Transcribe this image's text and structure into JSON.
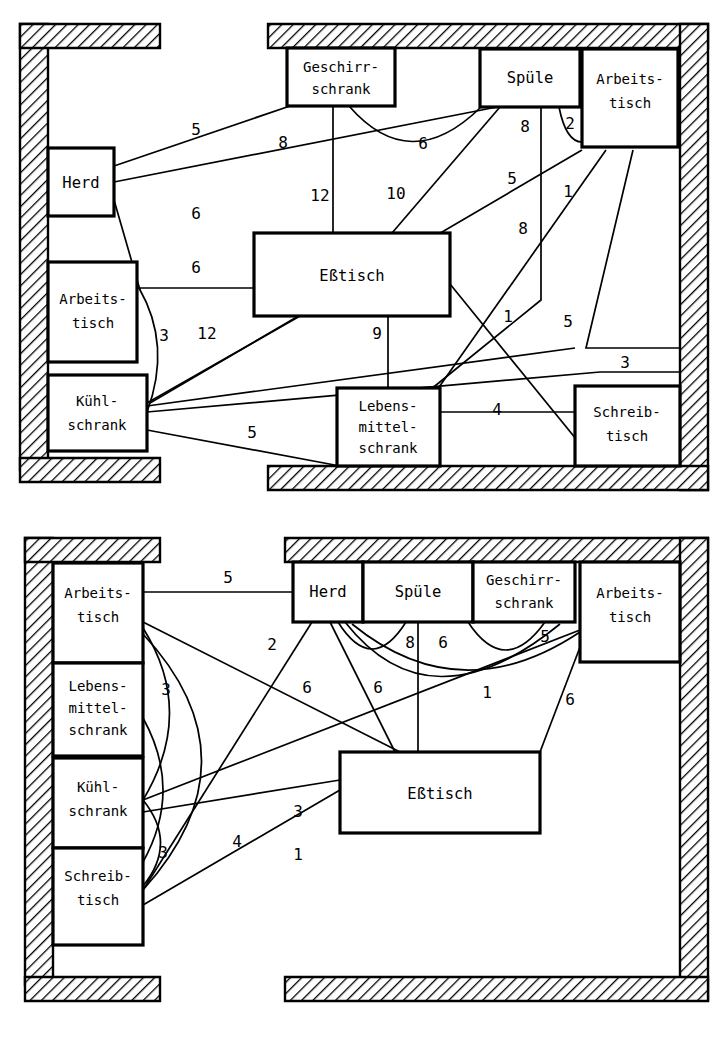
{
  "figure": {
    "kind": "floor-plan-relationship-diagram",
    "caption": "",
    "panels": [
      {
        "id": "top",
        "name": "kitchen-layout-variant-1",
        "boxes": [
          {
            "id": "herd",
            "label_lines": [
              "Herd"
            ],
            "x": 48,
            "y": 148,
            "w": 66,
            "h": 68
          },
          {
            "id": "geschirr",
            "label_lines": [
              "Geschirr-",
              "schrank"
            ],
            "x": 287,
            "y": 48,
            "w": 108,
            "h": 58
          },
          {
            "id": "spuele",
            "label_lines": [
              "Spüle"
            ],
            "x": 480,
            "y": 49,
            "w": 100,
            "h": 58
          },
          {
            "id": "arbeits_r",
            "label_lines": [
              "Arbeits-",
              "tisch"
            ],
            "x": 582,
            "y": 49,
            "w": 96,
            "h": 98
          },
          {
            "id": "esstisch",
            "label_lines": [
              "Eßtisch"
            ],
            "x": 254,
            "y": 233,
            "w": 196,
            "h": 83
          },
          {
            "id": "arbeits_l",
            "label_lines": [
              "Arbeits-",
              "tisch"
            ],
            "x": 48,
            "y": 262,
            "w": 89,
            "h": 100
          },
          {
            "id": "kuehl",
            "label_lines": [
              "Kühl-",
              "schrank"
            ],
            "x": 48,
            "y": 375,
            "w": 99,
            "h": 76
          },
          {
            "id": "lebensmittel",
            "label_lines": [
              "Lebens-",
              "mittel-",
              "schrank"
            ],
            "x": 337,
            "y": 388,
            "w": 103,
            "h": 78
          },
          {
            "id": "schreib",
            "label_lines": [
              "Schreib-",
              "tisch"
            ],
            "x": 575,
            "y": 386,
            "w": 105,
            "h": 80
          }
        ],
        "weights": [
          {
            "value": "5",
            "x": 196,
            "y": 130
          },
          {
            "value": "8",
            "x": 283,
            "y": 143
          },
          {
            "value": "6",
            "x": 423,
            "y": 144
          },
          {
            "value": "8",
            "x": 525,
            "y": 127
          },
          {
            "value": "2",
            "x": 570,
            "y": 124
          },
          {
            "value": "6",
            "x": 196,
            "y": 214
          },
          {
            "value": "12",
            "x": 320,
            "y": 196
          },
          {
            "value": "10",
            "x": 396,
            "y": 194
          },
          {
            "value": "5",
            "x": 512,
            "y": 179
          },
          {
            "value": "1",
            "x": 568,
            "y": 192
          },
          {
            "value": "8",
            "x": 523,
            "y": 229
          },
          {
            "value": "6",
            "x": 196,
            "y": 268
          },
          {
            "value": "3",
            "x": 164,
            "y": 336
          },
          {
            "value": "12",
            "x": 207,
            "y": 334
          },
          {
            "value": "9",
            "x": 377,
            "y": 334
          },
          {
            "value": "1",
            "x": 508,
            "y": 317
          },
          {
            "value": "5",
            "x": 568,
            "y": 322
          },
          {
            "value": "3",
            "x": 625,
            "y": 363
          },
          {
            "value": "4",
            "x": 497,
            "y": 410
          },
          {
            "value": "5",
            "x": 252,
            "y": 433
          }
        ]
      },
      {
        "id": "bottom",
        "name": "kitchen-layout-variant-2",
        "boxes": [
          {
            "id": "arbeits_l",
            "label_lines": [
              "Arbeits-",
              "tisch"
            ],
            "x": 53,
            "y": 563,
            "w": 90,
            "h": 100
          },
          {
            "id": "lebensmittel",
            "label_lines": [
              "Lebens-",
              "mittel-",
              "schrank"
            ],
            "x": 53,
            "y": 663,
            "w": 90,
            "h": 93
          },
          {
            "id": "kuehl",
            "label_lines": [
              "Kühl-",
              "schrank"
            ],
            "x": 53,
            "y": 758,
            "w": 90,
            "h": 90
          },
          {
            "id": "schreib",
            "label_lines": [
              "Schreib-",
              "tisch"
            ],
            "x": 53,
            "y": 848,
            "w": 90,
            "h": 97
          },
          {
            "id": "herd",
            "label_lines": [
              "Herd"
            ],
            "x": 293,
            "y": 562,
            "w": 70,
            "h": 60
          },
          {
            "id": "spuele",
            "label_lines": [
              "Spüle"
            ],
            "x": 363,
            "y": 562,
            "w": 110,
            "h": 60
          },
          {
            "id": "geschirr",
            "label_lines": [
              "Geschirr-",
              "schrank"
            ],
            "x": 473,
            "y": 562,
            "w": 102,
            "h": 60
          },
          {
            "id": "arbeits_r",
            "label_lines": [
              "Arbeits-",
              "tisch"
            ],
            "x": 580,
            "y": 562,
            "w": 100,
            "h": 100
          },
          {
            "id": "esstisch",
            "label_lines": [
              "Eßtisch"
            ],
            "x": 340,
            "y": 752,
            "w": 200,
            "h": 81
          }
        ],
        "weights": [
          {
            "value": "5",
            "x": 228,
            "y": 578
          },
          {
            "value": "2",
            "x": 272,
            "y": 645
          },
          {
            "value": "8",
            "x": 410,
            "y": 643
          },
          {
            "value": "6",
            "x": 443,
            "y": 643
          },
          {
            "value": "5",
            "x": 545,
            "y": 637
          },
          {
            "value": "3",
            "x": 166,
            "y": 690
          },
          {
            "value": "6",
            "x": 307,
            "y": 688
          },
          {
            "value": "6",
            "x": 378,
            "y": 688
          },
          {
            "value": "1",
            "x": 487,
            "y": 693
          },
          {
            "value": "6",
            "x": 570,
            "y": 700
          },
          {
            "value": "3",
            "x": 298,
            "y": 812
          },
          {
            "value": "4",
            "x": 237,
            "y": 842
          },
          {
            "value": "3",
            "x": 163,
            "y": 853
          },
          {
            "value": "1",
            "x": 298,
            "y": 855
          }
        ]
      }
    ]
  },
  "style": {
    "ink": "#000000",
    "paper": "#ffffff"
  }
}
